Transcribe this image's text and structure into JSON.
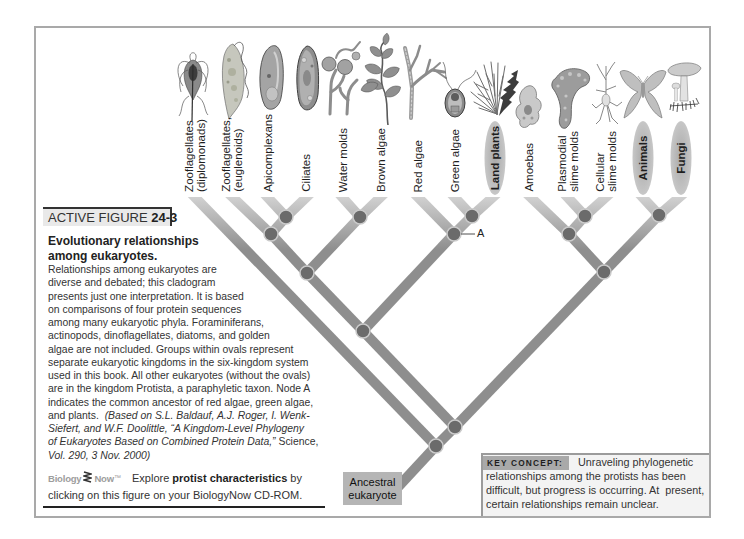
{
  "figure_header": {
    "prefix": "ACTIVE FIGURE",
    "number": "24-3"
  },
  "caption": {
    "title_lines": [
      "Evolutionary relationships",
      "among eukaryotes."
    ],
    "body_lines": [
      "Relationships among eukaryotes are",
      "diverse and debated; this cladogram",
      "presents just one interpretation. It is based",
      "on comparisons of four protein sequences",
      "among many eukaryotic phyla. Foraminiferans,",
      "actinopods, dinoflagellates, diatoms, and golden",
      "algae are not included. Groups within ovals represent",
      "separate eukaryotic kingdoms in the six-kingdom system",
      "used in this book. All other eukaryotes (without the ovals)",
      "are in the kingdom Protista, a paraphyletic taxon. Node A",
      "indicates the common ancestor of red algae, green algae,"
    ],
    "citation": {
      "lead": "and plants.  ",
      "line1": "(Based on S.L. Baldauf, A.J. Roger, I. Wenk-",
      "line2": "Siefert, and W.F. Doolittle, “A Kingdom-Level Phylogeny",
      "line3_italic": "of Eukaryotes Based on Combined Protein Data,”",
      "line3_journal": " Science,",
      "line4": "Vol. 290, 3 Nov. 2000)"
    }
  },
  "biologynow": {
    "logo_left": "Biology",
    "logo_right": "Now",
    "logo_tm": "™",
    "explore_prefix": "Explore ",
    "explore_bold": "protist characteristics",
    "explore_suffix": " by",
    "line2": "clicking on this figure on your BiologyNow CD-ROM."
  },
  "cladogram": {
    "taxa": [
      {
        "label": "Zooflagellates\n(diplomonads)",
        "kingdom_oval": false,
        "icon": "diplomonad-icon"
      },
      {
        "label": "Zooflagellates,\n(euglenoids)",
        "kingdom_oval": false,
        "icon": "euglenoid-icon"
      },
      {
        "label": "Apicomplexans",
        "kingdom_oval": false,
        "icon": "apicomplexan-icon"
      },
      {
        "label": "Ciliates",
        "kingdom_oval": false,
        "icon": "ciliate-icon"
      },
      {
        "label": "Water molds",
        "kingdom_oval": false,
        "icon": "water-mold-icon"
      },
      {
        "label": "Brown algae",
        "kingdom_oval": false,
        "icon": "brown-algae-icon"
      },
      {
        "label": "Red algae",
        "kingdom_oval": false,
        "icon": "red-algae-icon"
      },
      {
        "label": "Green algae",
        "kingdom_oval": false,
        "icon": "green-algae-icon"
      },
      {
        "label": "Land plants",
        "kingdom_oval": true,
        "icon": "land-plant-icon"
      },
      {
        "label": "Amoebas",
        "kingdom_oval": false,
        "icon": "amoeba-icon"
      },
      {
        "label": "Plasmodial\nslime molds",
        "kingdom_oval": false,
        "icon": "plasmodial-slime-mold-icon"
      },
      {
        "label": "Cellular\nslime molds",
        "kingdom_oval": false,
        "icon": "cellular-slime-mold-icon"
      },
      {
        "label": "Animals",
        "kingdom_oval": true,
        "icon": "moth-icon"
      },
      {
        "label": "Fungi",
        "kingdom_oval": true,
        "icon": "mushroom-icon"
      }
    ],
    "topology": "(Zooflagellates (diplomonads),((((Zooflagellates (euglenoids),(Apicomplexans,Ciliates)),(Water molds,Brown algae)),(Red algae,(Green algae,Land plants))A),((Amoebas,(Plasmodial slime molds,Cellular slime molds)),(Animals,Fungi))))",
    "node_label": "A",
    "root_label": "Ancestral\neukaryote",
    "colors": {
      "branch": "#8e8e8e",
      "branch_tip": "#d2d2d2",
      "node": "#6b6b6b",
      "oval": "#b3b3b3",
      "root_box": "#b5b5b5"
    }
  },
  "key_concept": {
    "label": "KEY CONCEPT:",
    "lines": [
      "Unraveling phylogenetic",
      "relationships among the protists has been",
      "difficult, but progress is occurring. At  present,",
      "certain relationships remain unclear."
    ]
  }
}
